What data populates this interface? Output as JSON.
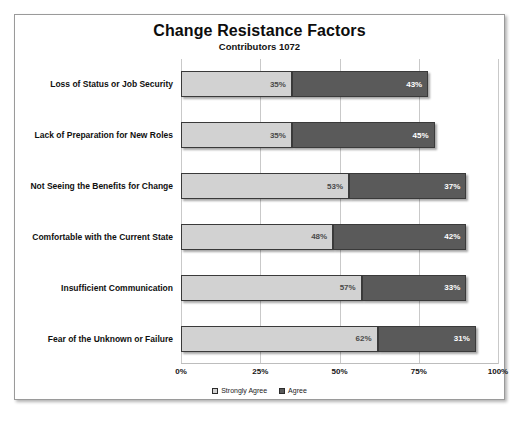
{
  "chart_data": {
    "type": "bar",
    "orientation": "horizontal",
    "stacked": true,
    "title": "Change Resistance Factors",
    "subtitle": "Contributors  1072",
    "xlabel": "",
    "ylabel": "",
    "xlim": [
      0,
      100
    ],
    "grid": true,
    "legend_position": "bottom",
    "tick_labels": [
      "0%",
      "25%",
      "50%",
      "75%",
      "100%"
    ],
    "tick_values": [
      0,
      25,
      50,
      75,
      100
    ],
    "categories": [
      "Loss of Status or Job Security",
      "Lack of Preparation for New Roles",
      "Not Seeing the Benefits for Change",
      "Comfortable with the Current State",
      "Insufficient Communication",
      "Fear of the Unknown or Failure"
    ],
    "series": [
      {
        "name": "Strongly Agree",
        "color": "#d2d2d2",
        "values": [
          35,
          35,
          53,
          48,
          57,
          62
        ],
        "labels": [
          "35%",
          "35%",
          "53%",
          "48%",
          "57%",
          "62%"
        ]
      },
      {
        "name": "Agree",
        "color": "#5a5a5a",
        "values": [
          43,
          45,
          37,
          42,
          33,
          31
        ],
        "labels": [
          "43%",
          "45%",
          "37%",
          "42%",
          "33%",
          "31%"
        ]
      }
    ]
  }
}
